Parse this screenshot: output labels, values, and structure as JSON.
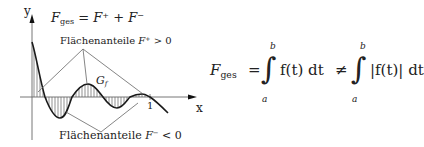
{
  "axes": {
    "y_label": "y",
    "x_label": "x",
    "x_tick": "1"
  },
  "top_formula": {
    "lhs": "F",
    "lhs_sub": "ges",
    "equals": "=",
    "term1": "F",
    "term1_sup": "+",
    "plus": "+",
    "term2": "F",
    "term2_sup": "−"
  },
  "label_positive": {
    "text": "Flächenanteile ",
    "var": "F",
    "sup": "+",
    "rel": " > 0"
  },
  "label_negative": {
    "text": "Flächenanteile ",
    "var": "F",
    "sup": "−",
    "rel": " < 0"
  },
  "graph_label": {
    "main": "G",
    "sub": "f"
  },
  "main_formula": {
    "lhs": "F",
    "lhs_sub": "ges",
    "equals": "=",
    "integral1_upper": "b",
    "integral1_lower": "a",
    "integrand1": "f(t) dt",
    "not_equals": "≠",
    "integral2_upper": "b",
    "integral2_lower": "a",
    "integrand2": "|f(t)| dt"
  },
  "colors": {
    "curve": "#1a1a1a",
    "axis": "#555555",
    "hatch": "#444444",
    "pointer_lines": "#666666"
  }
}
